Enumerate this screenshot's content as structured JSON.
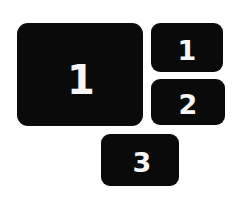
{
  "colors": {
    "canvas-bg": "#ffffff",
    "tile-bg": "#0a0a0a",
    "tile-text": "#f6f6f6"
  },
  "tiles": [
    {
      "label": "1"
    },
    {
      "label": "1"
    },
    {
      "label": "2"
    },
    {
      "label": "3"
    }
  ]
}
